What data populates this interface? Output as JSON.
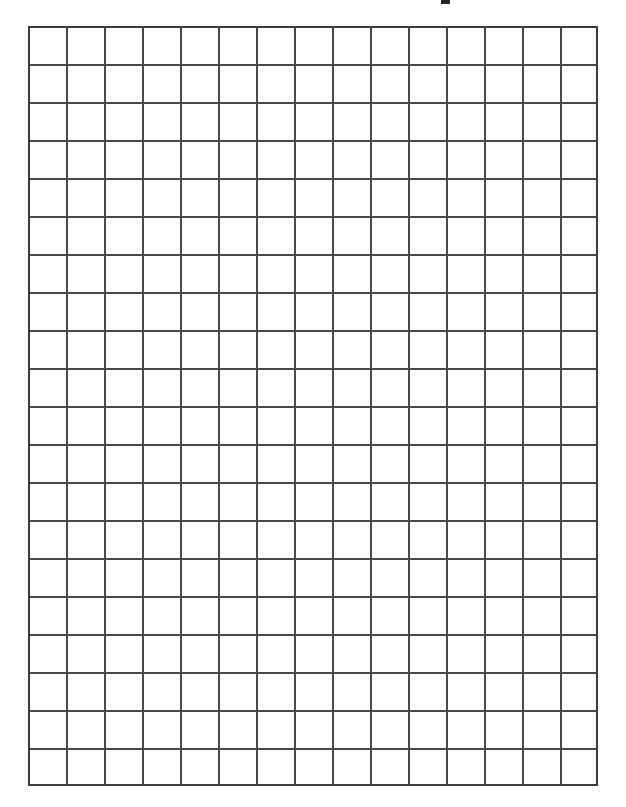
{
  "page": {
    "kind": "graph-paper",
    "width": 626,
    "height": 807,
    "background_color": "#ffffff"
  },
  "title_remnant": {
    "description": "bottom sliver of ink from a page heading cropped off above the top edge",
    "x": 441,
    "y": 0,
    "width": 9,
    "height": 4,
    "color": "#262626"
  },
  "grid": {
    "columns": 15,
    "rows": 20,
    "cell_size": 38,
    "left": 28,
    "top": 26,
    "width": 570,
    "height": 760,
    "line_color": "#4a4a4a",
    "line_width": 2,
    "border_color": "#3d3d3d",
    "border_width": 2,
    "cell_fill": "#ffffff"
  },
  "margins": {
    "left": 28,
    "right": 28,
    "top": 26,
    "bottom": 21
  }
}
